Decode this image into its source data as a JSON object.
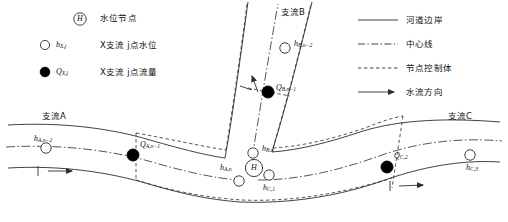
{
  "legend_left": {
    "items": [
      {
        "marker": "circle-open-H",
        "symbol": "H",
        "symbol_sub": "",
        "desc": "水位节点"
      },
      {
        "marker": "circle-open",
        "symbol": "h",
        "symbol_sub": "X,j",
        "desc": "X支流 j点水位"
      },
      {
        "marker": "circle-filled",
        "symbol": "Q",
        "symbol_sub": "X,j",
        "desc": "X支流 j点流量"
      }
    ]
  },
  "legend_right": {
    "items": [
      {
        "style": "solid",
        "desc": "河道边岸"
      },
      {
        "style": "dash-dot",
        "desc": "中心线"
      },
      {
        "style": "dashed",
        "desc": "节点控制体"
      },
      {
        "style": "arrow",
        "desc": "水流方向"
      }
    ]
  },
  "branches": [
    {
      "id": "A",
      "label": "支流A"
    },
    {
      "id": "B",
      "label": "支流B"
    },
    {
      "id": "C",
      "label": "支流C"
    }
  ],
  "nodes": [
    {
      "name": "h-A-n-2",
      "type": "water-level",
      "symbol": "h",
      "sub": "A,n−2"
    },
    {
      "name": "Q-A-n-1",
      "type": "discharge",
      "symbol": "Q",
      "sub": "A,n−1"
    },
    {
      "name": "h-A-n",
      "type": "water-level",
      "symbol": "h",
      "sub": "A,n"
    },
    {
      "name": "h-B-n-2",
      "type": "water-level",
      "symbol": "h",
      "sub": "B,n−2"
    },
    {
      "name": "Q-B-n-1",
      "type": "discharge",
      "symbol": "Q",
      "sub": "B,n−1"
    },
    {
      "name": "h-B-n",
      "type": "water-level",
      "symbol": "h",
      "sub": "B,n"
    },
    {
      "name": "junction-H",
      "type": "junction",
      "symbol": "H",
      "sub": ""
    },
    {
      "name": "h-C-1",
      "type": "water-level",
      "symbol": "h",
      "sub": "C,1"
    },
    {
      "name": "Q-C-2",
      "type": "discharge",
      "symbol": "Q",
      "sub": "C,2"
    },
    {
      "name": "h-C-3",
      "type": "water-level",
      "symbol": "h",
      "sub": "C,3"
    }
  ],
  "colors": {
    "line": "#2b2b2b",
    "fill_node": "#000000",
    "node_open": "#ffffff",
    "background": "#ffffff"
  }
}
